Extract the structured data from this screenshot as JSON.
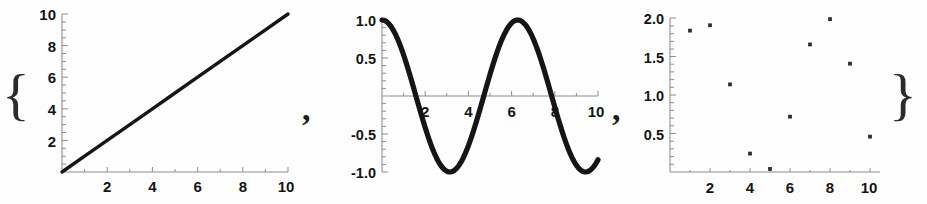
{
  "expression": {
    "open_brace": "{",
    "close_brace": "}",
    "separator_1": ",",
    "separator_2": ","
  },
  "chart_data": [
    {
      "id": "panel-1-linear",
      "type": "line",
      "title": "",
      "xlabel": "",
      "ylabel": "",
      "xlim": [
        0,
        10
      ],
      "ylim": [
        0,
        10
      ],
      "grid": false,
      "legend": "none",
      "x_ticks": [
        2,
        4,
        6,
        8,
        10
      ],
      "x_tick_labels": [
        "2",
        "4",
        "6",
        "8",
        "10"
      ],
      "y_ticks": [
        2,
        4,
        6,
        8,
        10
      ],
      "y_tick_labels": [
        "2",
        "4",
        "6",
        "8",
        "10"
      ],
      "series": [
        {
          "name": "x",
          "x": [
            0,
            1,
            2,
            3,
            4,
            5,
            6,
            7,
            8,
            9,
            10
          ],
          "values": [
            0,
            1,
            2,
            3,
            4,
            5,
            6,
            7,
            8,
            9,
            10
          ]
        }
      ]
    },
    {
      "id": "panel-2-cosine",
      "type": "line",
      "title": "",
      "xlabel": "",
      "ylabel": "",
      "xlim": [
        0,
        10
      ],
      "ylim": [
        -1,
        1
      ],
      "grid": false,
      "legend": "none",
      "x_ticks": [
        2,
        4,
        6,
        8,
        10
      ],
      "x_tick_labels": [
        "2",
        "4",
        "6",
        "8",
        "10"
      ],
      "y_ticks": [
        -1.0,
        -0.5,
        0.5,
        1.0
      ],
      "y_tick_labels": [
        "-1.0",
        "-0.5",
        "0.5",
        "1.0"
      ],
      "series": [
        {
          "name": "cos(x)",
          "x": [
            0,
            0.5,
            1,
            1.5,
            2,
            2.5,
            3,
            3.5,
            4,
            4.5,
            5,
            5.5,
            6,
            6.5,
            7,
            7.5,
            8,
            8.5,
            9,
            9.5,
            10
          ],
          "values": [
            1.0,
            0.878,
            0.54,
            0.071,
            -0.416,
            -0.801,
            -0.99,
            -0.936,
            -0.654,
            -0.211,
            0.284,
            0.709,
            0.96,
            0.977,
            0.754,
            0.347,
            -0.146,
            -0.602,
            -0.911,
            -0.997,
            -0.839
          ]
        }
      ]
    },
    {
      "id": "panel-3-scatter",
      "type": "scatter",
      "title": "",
      "xlabel": "",
      "ylabel": "",
      "xlim": [
        0,
        10.5
      ],
      "ylim": [
        0,
        2.05
      ],
      "grid": false,
      "legend": "none",
      "x_ticks": [
        2,
        4,
        6,
        8,
        10
      ],
      "x_tick_labels": [
        "2",
        "4",
        "6",
        "8",
        "10"
      ],
      "y_ticks": [
        0.5,
        1.0,
        1.5,
        2.0
      ],
      "y_tick_labels": [
        "0.5",
        "1.0",
        "1.5",
        "2.0"
      ],
      "series": [
        {
          "name": "1+sin(x)",
          "x": [
            1,
            2,
            3,
            4,
            5,
            6,
            7,
            8,
            9,
            10
          ],
          "values": [
            1.84,
            1.91,
            1.14,
            0.24,
            0.04,
            0.72,
            1.66,
            1.99,
            1.41,
            0.46
          ]
        }
      ]
    }
  ]
}
